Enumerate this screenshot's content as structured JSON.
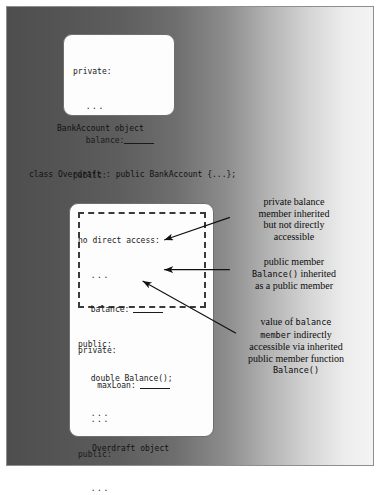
{
  "figure": {
    "background_gradient_from": "#4e4e4e",
    "background_gradient_to": "#f4f4f4",
    "border_color": "#8e8e8e"
  },
  "base_class_panel": {
    "caption": "BankAccount object",
    "code_lines": [
      {
        "text": "private:",
        "indent": 0,
        "underline": false
      },
      {
        "text": "...",
        "indent": 1,
        "underline": false
      },
      {
        "text": "balance:",
        "indent": 1,
        "underline": true
      },
      {
        "text": "public:",
        "indent": 0,
        "underline": false
      },
      {
        "text": "double Balance();",
        "indent": 1,
        "underline": false
      },
      {
        "text": "...",
        "indent": 1,
        "underline": false
      }
    ],
    "line1": "private:",
    "line2": "...",
    "line3": "balance:",
    "line4": "public:",
    "line5": "double Balance();",
    "line6": "..."
  },
  "class_declaration": "class Overdraft : public BankAccount {...};",
  "derived_class_panel": {
    "caption": "Overdraft object",
    "inherited_region": {
      "line1": "no direct access:",
      "line2": "...",
      "line3": "balance:",
      "line4": "public:",
      "line5": "double Balance();",
      "line6": "..."
    },
    "own_members": {
      "line1": "private:",
      "line2": "maxLoan:",
      "line3": "...",
      "line4": "public:",
      "line5": "..."
    }
  },
  "annotations": {
    "private_balance": {
      "line1": "private balance",
      "line2": "member inherited",
      "line3": "but not directly",
      "line4": "accessible"
    },
    "public_member": {
      "line1": "public member",
      "line2_mono": "Balance()",
      "line2_rest": " inherited",
      "line3": "as a public member"
    },
    "value_of_balance": {
      "line1_pre": "value of ",
      "line1_mono": "balance",
      "line2_mono": "member",
      "line2_rest": " indirectly",
      "line3": "accessible via inherited",
      "line4": "public member function",
      "line5_mono": "Balance()"
    }
  }
}
